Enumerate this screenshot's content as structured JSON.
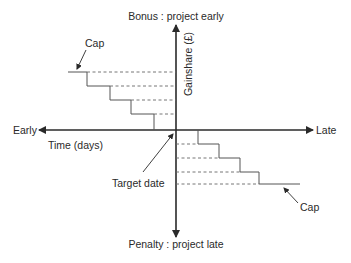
{
  "diagram": {
    "labels": {
      "top": "Bonus : project early",
      "bottom": "Penalty : project late",
      "left": "Early",
      "right": "Late",
      "x_axis": "Time (days)",
      "y_axis": "Gainshare (£)",
      "origin": "Target date",
      "cap_upper": "Cap",
      "cap_lower": "Cap"
    },
    "colors": {
      "axis": "#2a2a2a",
      "step": "#555555",
      "dashed": "#666666",
      "text": "#2a2a2a"
    }
  }
}
